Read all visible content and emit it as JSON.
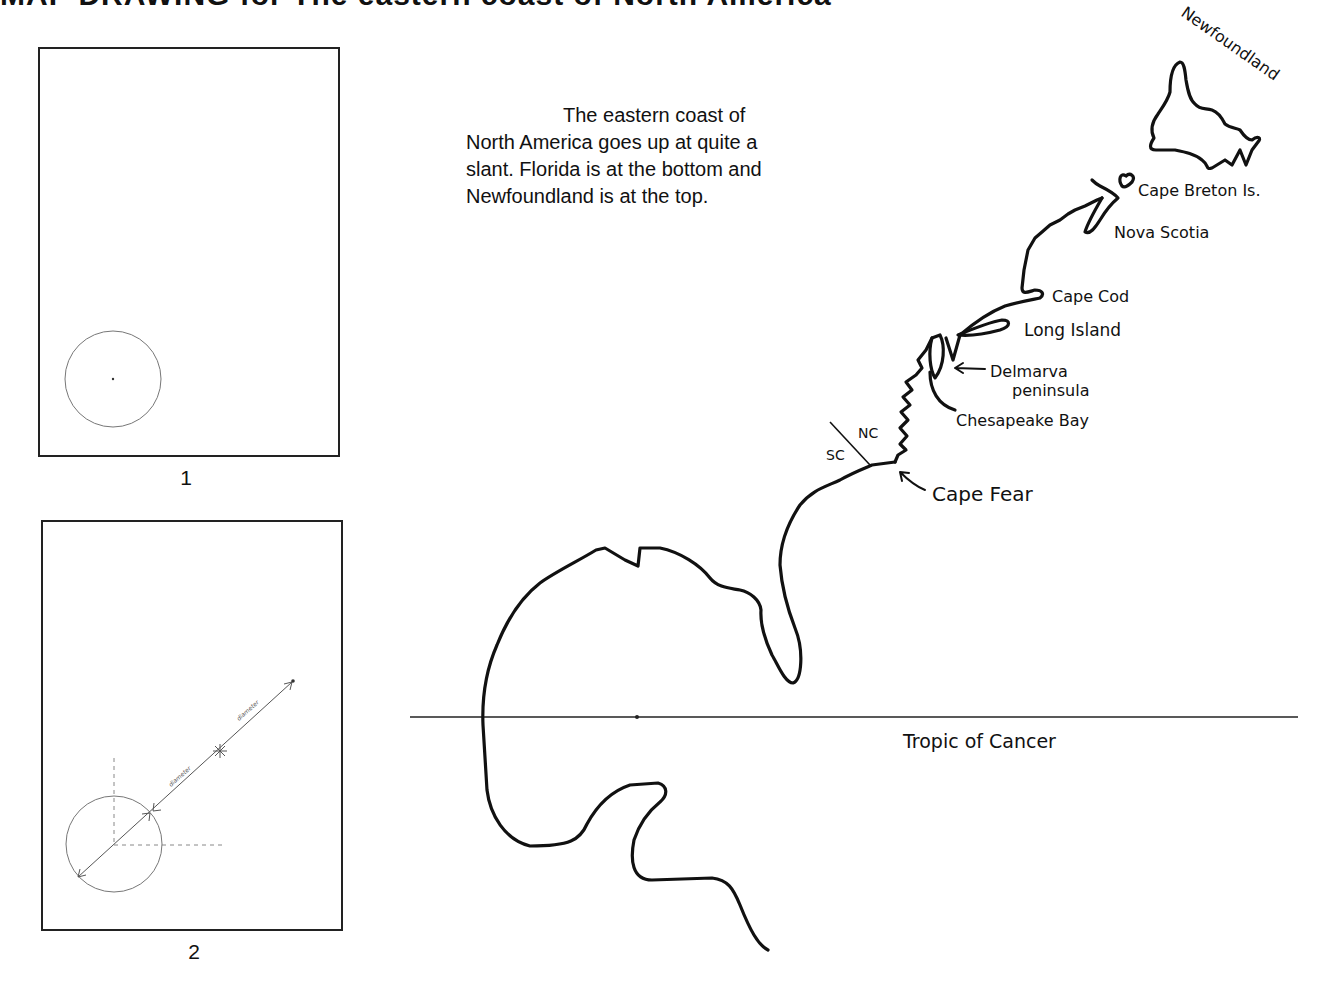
{
  "title": "MAP DRAWING for The eastern coast of North America",
  "panels": [
    {
      "number": "1",
      "description": "Circle with center dot in lower-left of frame"
    },
    {
      "number": "2",
      "description": "Circle with diameter extended diagonally twice, with dashed guide lines",
      "diameter_label_1": "diameter",
      "diameter_label_2": "diameter"
    }
  ],
  "intro": {
    "line1": "The eastern coast of",
    "line2": "North America goes up at quite a",
    "line3": "slant.  Florida is at the bottom and",
    "line4": "Newfoundland is at the top."
  },
  "map_labels": {
    "newfoundland": "Newfoundland",
    "cape_breton": "Cape Breton Is.",
    "nova_scotia": "Nova Scotia",
    "cape_cod": "Cape Cod",
    "long_island": "Long Island",
    "delmarva_1": "Delmarva",
    "delmarva_2": "peninsula",
    "chesapeake": "Chesapeake Bay",
    "nc": "NC",
    "sc": "SC",
    "cape_fear": "Cape Fear",
    "tropic": "Tropic of Cancer"
  },
  "colors": {
    "ink": "#111111",
    "guide": "#777777",
    "background": "#ffffff"
  }
}
